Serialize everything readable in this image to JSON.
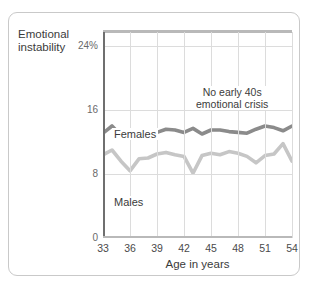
{
  "figure": {
    "y_axis_title": "Emotional\ninstability",
    "x_axis_title": "Age in years",
    "annotation": "No early 40s\nemotional crisis"
  },
  "colors": {
    "females_line": "#8b8b8b",
    "males_line": "#c6c6c6",
    "gridline": "#dcdcdc",
    "axis": "#6f6f6f",
    "card_border": "#c9c9c9",
    "text": "#3b3b3b"
  },
  "labels": {
    "females": "Females",
    "males": "Males"
  },
  "chart_data": {
    "type": "line",
    "title": "",
    "xlabel": "Age in years",
    "ylabel": "Emotional instability",
    "xlim": [
      33,
      54
    ],
    "ylim": [
      0,
      26
    ],
    "grid": true,
    "legend": "inline-labels",
    "annotations": [
      {
        "text": "No early 40s emotional crisis",
        "x": 46.5,
        "y": 20.5
      }
    ],
    "y_ticks": [
      0,
      8,
      16,
      24
    ],
    "y_tick_labels": [
      "0",
      "8",
      "16",
      "24%"
    ],
    "x_ticks": [
      33,
      36,
      39,
      42,
      45,
      48,
      51,
      54
    ],
    "x_tick_labels": [
      "33",
      "36",
      "39",
      "42",
      "45",
      "48",
      "51",
      "54"
    ],
    "x": [
      33,
      34,
      35,
      36,
      37,
      38,
      39,
      40,
      41,
      42,
      43,
      44,
      45,
      46,
      47,
      48,
      49,
      50,
      51,
      52,
      53,
      54
    ],
    "series": [
      {
        "name": "Females",
        "color": "#8b8b8b",
        "values": [
          13.1,
          14.0,
          12.8,
          12.6,
          13.1,
          13.0,
          13.2,
          13.6,
          13.5,
          13.2,
          13.7,
          13.0,
          13.5,
          13.5,
          13.3,
          13.2,
          13.1,
          13.6,
          14.0,
          13.8,
          13.4,
          14.0
        ]
      },
      {
        "name": "Males",
        "color": "#c6c6c6",
        "values": [
          10.4,
          11.0,
          9.6,
          8.4,
          9.9,
          10.0,
          10.5,
          10.7,
          10.4,
          10.2,
          8.1,
          10.3,
          10.6,
          10.4,
          10.8,
          10.6,
          10.2,
          9.4,
          10.3,
          10.5,
          11.8,
          9.6
        ]
      }
    ]
  }
}
